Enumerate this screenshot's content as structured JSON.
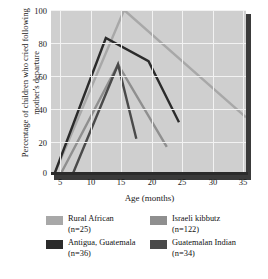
{
  "chart_data": {
    "type": "line",
    "title": "",
    "xlabel": "Age (months)",
    "ylabel": "Percentage of children who cried following mother's departure",
    "xlim": [
      3,
      35
    ],
    "ylim": [
      0,
      100
    ],
    "xticks": [
      5,
      10,
      15,
      20,
      25,
      30,
      35
    ],
    "yticks": [
      0,
      20,
      40,
      60,
      80,
      100
    ],
    "grid": true,
    "legend_position": "below",
    "plot_background": "#cfcfcf",
    "gridline_color": "#f2f2f2",
    "series": [
      {
        "name": "Rural African",
        "n": 25,
        "legend_label": "Rural African",
        "legend_n": "(n=25)",
        "color": "#a8a8a8",
        "points": [
          [
            3.5,
            0
          ],
          [
            15,
            100
          ],
          [
            35,
            35
          ]
        ]
      },
      {
        "name": "Antigua, Guatemala",
        "n": 36,
        "legend_label": "Antigua, Guatemala",
        "legend_n": "(n=36)",
        "color": "#2b2b2b",
        "points": [
          [
            3.5,
            0
          ],
          [
            12,
            83
          ],
          [
            19,
            69
          ],
          [
            24,
            32
          ]
        ]
      },
      {
        "name": "Israeli kibbutz",
        "n": 122,
        "legend_label": "Israeli kibbutz",
        "legend_n": "(n=122)",
        "color": "#8f8f8f",
        "points": [
          [
            4.5,
            0
          ],
          [
            14,
            67
          ],
          [
            22,
            17
          ]
        ]
      },
      {
        "name": "Guatemalan Indian",
        "n": 34,
        "legend_label": "Guatemalan Indian",
        "legend_n": "(n=34)",
        "color": "#4a4a4a",
        "points": [
          [
            6.5,
            0
          ],
          [
            14,
            67
          ],
          [
            17,
            22
          ]
        ]
      }
    ]
  },
  "axis": {
    "y_title": "Percentage of children who cried following mother's departure",
    "x_title": "Age (months)",
    "yticks": [
      "100",
      "80",
      "60",
      "40",
      "20",
      "0"
    ],
    "xticks": [
      "5",
      "10",
      "15",
      "20",
      "25",
      "30",
      "35"
    ]
  },
  "legend": {
    "entries": [
      {
        "label": "Rural African",
        "n": "(n=25)",
        "color": "#a8a8a8"
      },
      {
        "label": "Antigua, Guatemala",
        "n": "(n=36)",
        "color": "#2b2b2b"
      },
      {
        "label": "Israeli kibbutz",
        "n": "(n=122)",
        "color": "#8f8f8f"
      },
      {
        "label": "Guatemalan Indian",
        "n": "(n=34)",
        "color": "#4a4a4a"
      }
    ]
  }
}
